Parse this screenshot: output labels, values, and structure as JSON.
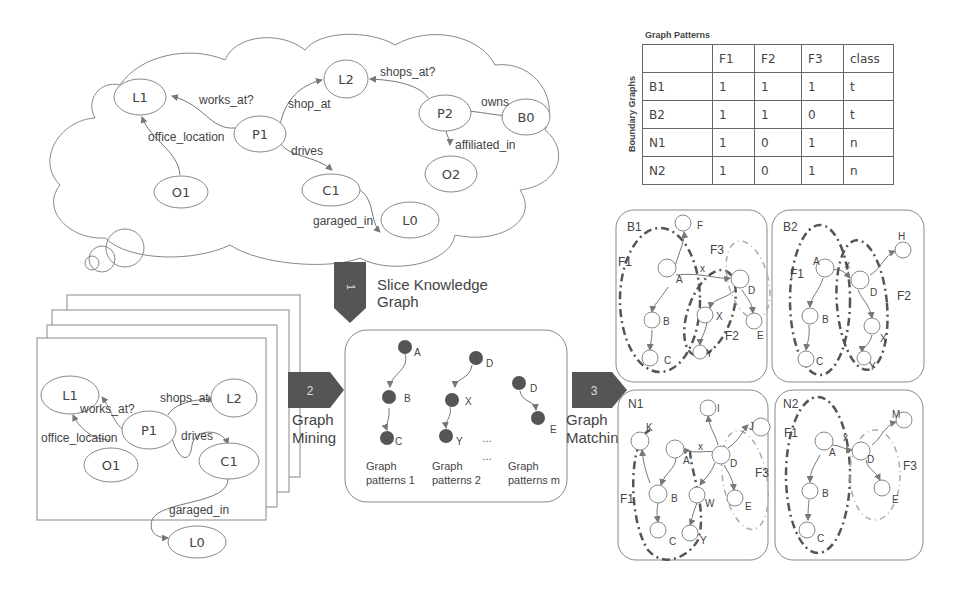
{
  "knowledge_graph": {
    "nodes": [
      "L1",
      "L2",
      "P1",
      "P2",
      "B0",
      "O1",
      "O2",
      "C1",
      "L0"
    ],
    "edges": [
      {
        "from": "P1",
        "to": "L1",
        "label": "works_at?"
      },
      {
        "from": "O1",
        "to": "L1",
        "label": "office_location"
      },
      {
        "from": "P1",
        "to": "L2",
        "label": "shop_at"
      },
      {
        "from": "P2",
        "to": "L2",
        "label": "shops_at?"
      },
      {
        "from": "P2",
        "to": "B0",
        "label": "owns"
      },
      {
        "from": "P2",
        "to": "O2",
        "label": "affiliated_in"
      },
      {
        "from": "P1",
        "to": "C1",
        "label": "drives"
      },
      {
        "from": "C1",
        "to": "L0",
        "label": "garaged_in"
      }
    ]
  },
  "table": {
    "title": "Graph Patterns",
    "side_label": "Boundary Graphs",
    "headers": [
      "",
      "F1",
      "F2",
      "F3",
      "class"
    ],
    "rows": [
      [
        "B1",
        "1",
        "1",
        "1",
        "t"
      ],
      [
        "B2",
        "1",
        "1",
        "0",
        "t"
      ],
      [
        "N1",
        "1",
        "0",
        "1",
        "n"
      ],
      [
        "N2",
        "1",
        "0",
        "1",
        "n"
      ]
    ]
  },
  "steps": {
    "s1": {
      "num": "1",
      "label1": "Slice Knowledge",
      "label2": "Graph"
    },
    "s2": {
      "num": "2",
      "label1": "Graph",
      "label2": "Mining"
    },
    "s3": {
      "num": "3",
      "label1": "Graph",
      "label2": "Matching"
    }
  },
  "slice": {
    "nodes": [
      "L1",
      "L2",
      "P1",
      "O1",
      "C1",
      "L0"
    ],
    "edges": [
      {
        "from": "P1",
        "to": "L1",
        "label": "works_at?"
      },
      {
        "from": "O1",
        "to": "L1",
        "label": "office_location"
      },
      {
        "from": "P1",
        "to": "L2",
        "label": "shops_at"
      },
      {
        "from": "P1",
        "to": "C1",
        "label": "drives"
      },
      {
        "from": "C1",
        "to": "L0",
        "label": "garaged_in"
      }
    ]
  },
  "patterns": {
    "p1": {
      "nodes": [
        "A",
        "B",
        "C"
      ],
      "caption1": "Graph",
      "caption2": "patterns 1"
    },
    "p2": {
      "nodes": [
        "D",
        "X",
        "Y"
      ],
      "caption1": "Graph",
      "caption2": "patterns 2"
    },
    "pm": {
      "nodes": [
        "D",
        "E"
      ],
      "caption1": "Graph",
      "caption2": "patterns m"
    },
    "ellipsis": "…"
  },
  "boundary": {
    "B1": {
      "title": "B1",
      "nodes": [
        "F",
        "A",
        "B",
        "C",
        "D",
        "X",
        "Y",
        "E"
      ],
      "features": [
        "F1",
        "F2",
        "F3"
      ],
      "edge_x": "x"
    },
    "B2": {
      "title": "B2",
      "nodes": [
        "A",
        "B",
        "C",
        "D",
        "X",
        "Y",
        "H"
      ],
      "features": [
        "F1",
        "F2"
      ],
      "edge_x": "x"
    },
    "N1": {
      "title": "N1",
      "nodes": [
        "K",
        "A",
        "B",
        "C",
        "D",
        "I",
        "J",
        "W",
        "Y",
        "E"
      ],
      "features": [
        "F1",
        "F3"
      ],
      "edge_x": "x"
    },
    "N2": {
      "title": "N2",
      "nodes": [
        "A",
        "B",
        "C",
        "D",
        "E",
        "M"
      ],
      "features": [
        "F1",
        "F3"
      ],
      "edge_x": "x"
    }
  }
}
